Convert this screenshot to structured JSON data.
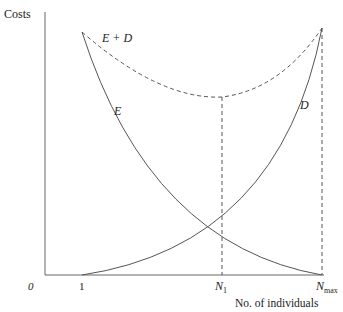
{
  "diagram": {
    "y_axis_label": "Costs",
    "x_axis_label": "No. of individuals",
    "origin_label": "0",
    "x_ticks": [
      {
        "label": "1"
      },
      {
        "main": "N",
        "sub": "1"
      },
      {
        "main": "N",
        "sub": "max"
      }
    ],
    "curves": [
      {
        "name": "E",
        "label": "E",
        "style": "solid"
      },
      {
        "name": "D",
        "label": "D",
        "style": "solid"
      },
      {
        "name": "E+D",
        "label": "E + D",
        "style": "dashed"
      }
    ],
    "colors": {
      "line": "#555555",
      "text": "#222222",
      "background": "#ffffff"
    }
  }
}
